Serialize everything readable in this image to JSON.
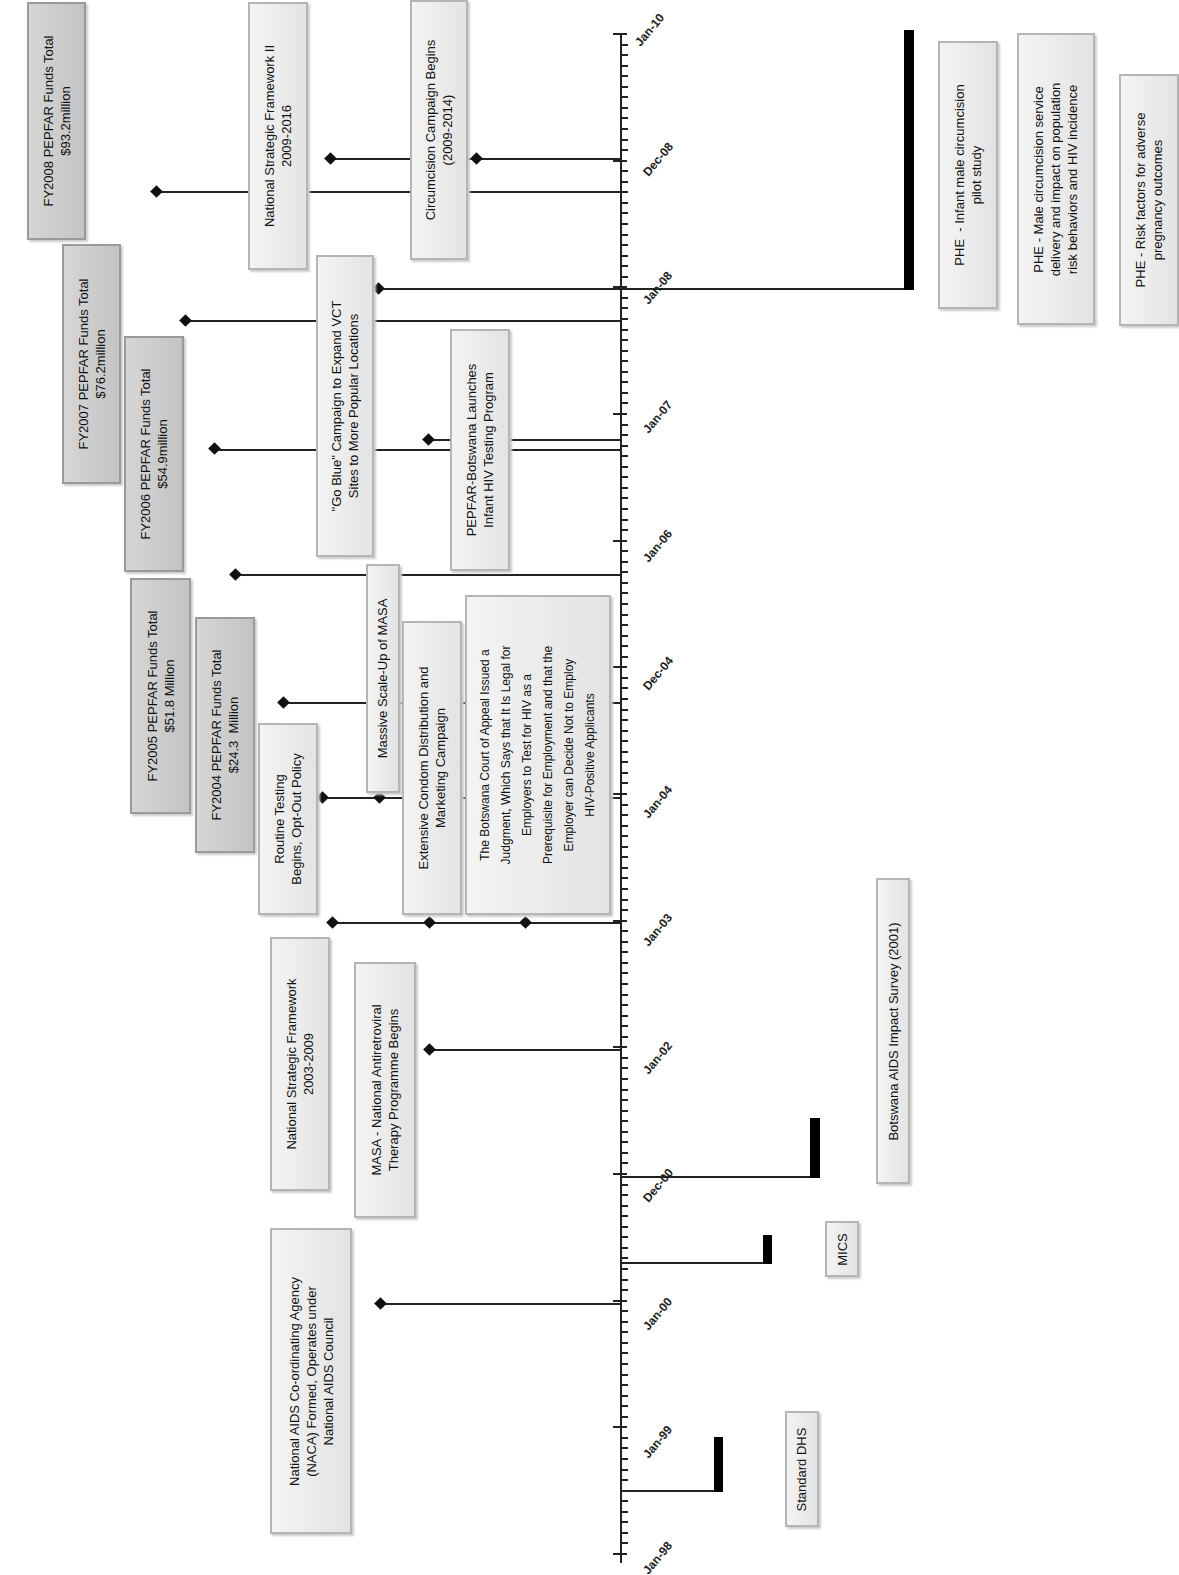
{
  "chart_data": {
    "type": "timeline",
    "title": "",
    "axis": {
      "orientation": "vertical",
      "direction": "bottom-to-top",
      "range": [
        "Jan-98",
        "Jan-10"
      ],
      "tick_labels": [
        "Jan-98",
        "Jan-99",
        "Jan-00",
        "Dec-00",
        "Jan-02",
        "Jan-03",
        "Jan-04",
        "Dec-04",
        "Jan-06",
        "Jan-07",
        "Jan-08",
        "Dec-08",
        "Jan-10"
      ],
      "minor_ticks": "monthly"
    },
    "events": [
      {
        "label": "National AIDS Co-ordinating Agency (NACA) Formed, Operates under National AIDS Council",
        "date": "1999-09"
      },
      {
        "label": "MASA - National Antiretroviral Therapy Programme Begins",
        "date": "2002-01"
      },
      {
        "label": "National Strategic Framework 2003-2009",
        "date": "2003-01"
      },
      {
        "label": "Routine Testing Begins, Opt-Out Policy",
        "date": "2004-01"
      },
      {
        "label": "Extensive Condom Distribution and Marketing Campaign",
        "date": "2003-01"
      },
      {
        "label": "The Botswana Court of Appeal Issued a Judgment, Which Says that It Is Legal for Employers to Test for HIV as a Prerequisite for Employment and that the Employer can Decide Not to Employ HIV-Positive Applicants",
        "date": "2003-01"
      },
      {
        "label": "Massive Scale-Up of MASA",
        "date": "2004-01"
      },
      {
        "label": "FY2004 PEPFAR Funds Total $24.3 Million",
        "date": "2004-12"
      },
      {
        "label": "FY2005 PEPFAR Funds Total $51.8 Million",
        "date": "2005-12"
      },
      {
        "label": "FY2006 PEPFAR Funds Total $54.9million",
        "date": "2006-10"
      },
      {
        "label": "PEPFAR-Botswana Launches Infant HIV Testing Program",
        "date": "2006-10"
      },
      {
        "label": "\"Go Blue\" Campaign to Expand VCT Sites to More Popular Locations",
        "date": "2008-01"
      },
      {
        "label": "FY2007 PEPFAR Funds Total $76.2million",
        "date": "2007-10"
      },
      {
        "label": "National Strategic Framework II 2009-2016",
        "date": "2008-12"
      },
      {
        "label": "Circumcision Campaign Begins (2009-2014)",
        "date": "2008-12"
      },
      {
        "label": "FY2008 PEPFAR Funds Total $93.2million",
        "date": "2009-03"
      }
    ],
    "surveys": [
      {
        "label": "Standard DHS",
        "date": "1998-06"
      },
      {
        "label": "MICS",
        "date": "2000-03"
      },
      {
        "label": "Botswana AIDS Impact Survey (2001)",
        "date": "2000-12"
      },
      {
        "label": "PHE - Infant male circumcision pilot study",
        "date": "2008-01"
      },
      {
        "label": "PHE - Male circumcision service delivery and impact on population risk behaviors and HIV incidence",
        "date": "2008-01"
      },
      {
        "label": "PHE - Risk factors for adverse pregnancy outcomes",
        "date": "2008-01"
      }
    ]
  },
  "ticks": [
    "Jan-10",
    "Dec-08",
    "Jan-08",
    "Jan-07",
    "Jan-06",
    "Dec-04",
    "Jan-04",
    "Jan-03",
    "Jan-02",
    "Dec-00",
    "Jan-00",
    "Jan-99",
    "Jan-98"
  ],
  "boxes": {
    "fy2008": "FY2008 PEPFAR Funds Total\n$93.2million",
    "nsf2": "National Strategic Framework II\n2009-2016",
    "circ": "Circumcision Campaign Begins\n(2009-2014)",
    "fy2007": "FY2007 PEPFAR Funds Total\n$76.2million",
    "goblue": "\"Go Blue\" Campaign to Expand VCT\nSites to More Popular Locations",
    "fy2006": "FY2006 PEPFAR Funds Total\n$54.9million",
    "infant": "PEPFAR-Botswana Launches\nInfant HIV Testing Program",
    "fy2005": "FY2005 PEPFAR Funds Total\n$51.8 Million",
    "fy2004": "FY2004 PEPFAR Funds Total\n$24.3  Million",
    "massive": "Massive Scale-Up of MASA",
    "routine": "Routine Testing\nBegins, Opt-Out Policy",
    "condom": "Extensive Condom Distribution and\nMarketing Campaign",
    "court": "The Botswana Court of Appeal Issued a\nJudgment, Which Says that It Is Legal for\nEmployers to Test for HIV as a\nPrerequisite for Employment and that the\nEmployer can Decide Not to Employ\nHIV-Positive Applicants",
    "nsf": "National Strategic Framework\n2003-2009",
    "masa": "MASA - National Antiretroviral\nTherapy Programme Begins",
    "naca": "National AIDS Co-ordinating Agency\n(NACA) Formed, Operates under\nNational AIDS Council",
    "phe1": "PHE  - Infant male circumcision\npilot study",
    "phe2": "PHE - Male circumcision service\ndelivery and impact on population\nrisk behaviors and HIV incidence",
    "phe3": "PHE - Risk factors for adverse\npregnancy outcomes",
    "bais": "Botswana AIDS Impact Survey (2001)",
    "mics": "MICS",
    "dhs": "Standard DHS"
  }
}
